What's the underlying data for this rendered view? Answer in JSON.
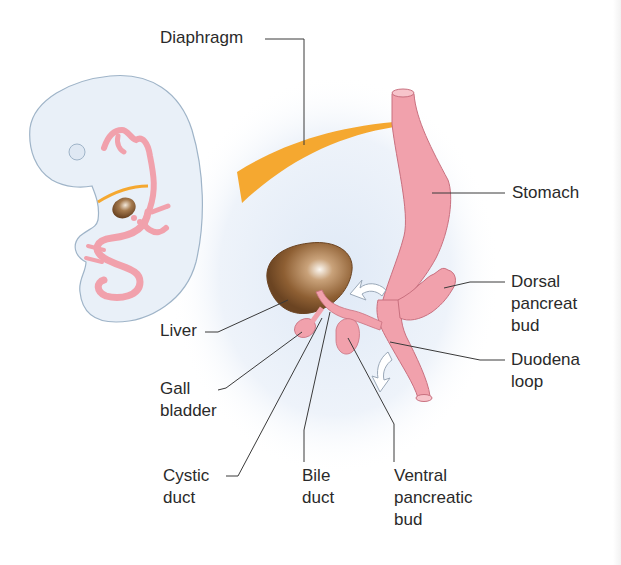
{
  "diagram": {
    "type": "anatomical-illustration",
    "colors": {
      "background": "#ffffff",
      "embryo_fill": "#e9f0f8",
      "embryo_outline": "#9fb4c8",
      "gut_pink": "#f1a1ac",
      "gut_outline": "#c9707f",
      "diaphragm_orange": "#f5a830",
      "liver_brown": "#8a5a2e",
      "liver_highlight": "#f6efe6",
      "leader_line": "#3a3a3a",
      "text": "#2a2a2a",
      "bg_glow": "#e6eef8"
    }
  },
  "labels": {
    "diaphragm": "Diaphragm",
    "stomach": "Stomach",
    "dorsal_pancreatic_bud": "Dorsal\npancreat\nbud",
    "duodenal_loop": "Duodena\nloop",
    "liver": "Liver",
    "gall_bladder": "Gall\nbladder",
    "cystic_duct": "Cystic\nduct",
    "bile_duct": "Bile\nduct",
    "ventral_pancreatic_bud": "Ventral\npancreatic\nbud"
  }
}
